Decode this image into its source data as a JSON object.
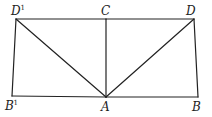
{
  "diagram": {
    "type": "geometry",
    "points": {
      "D1": {
        "label": "D",
        "prime": "1",
        "x": 16,
        "y": 19
      },
      "C": {
        "label": "C",
        "x": 106,
        "y": 19
      },
      "D": {
        "label": "D",
        "x": 194,
        "y": 19
      },
      "B1": {
        "label": "B",
        "prime": "1",
        "x": 12,
        "y": 96
      },
      "A": {
        "label": "A",
        "x": 106,
        "y": 97
      },
      "B": {
        "label": "B",
        "x": 198,
        "y": 97
      }
    },
    "segments": [
      [
        "D1",
        "C"
      ],
      [
        "C",
        "D"
      ],
      [
        "D1",
        "B1"
      ],
      [
        "B1",
        "A"
      ],
      [
        "A",
        "B"
      ],
      [
        "D",
        "B"
      ],
      [
        "C",
        "A"
      ],
      [
        "D1",
        "A"
      ],
      [
        "D",
        "A"
      ]
    ],
    "labels": {
      "D1": "D",
      "D1_sup": "1",
      "C": "C",
      "D": "D",
      "B1": "B",
      "B1_sup": "1",
      "A": "A",
      "B": "B"
    }
  }
}
